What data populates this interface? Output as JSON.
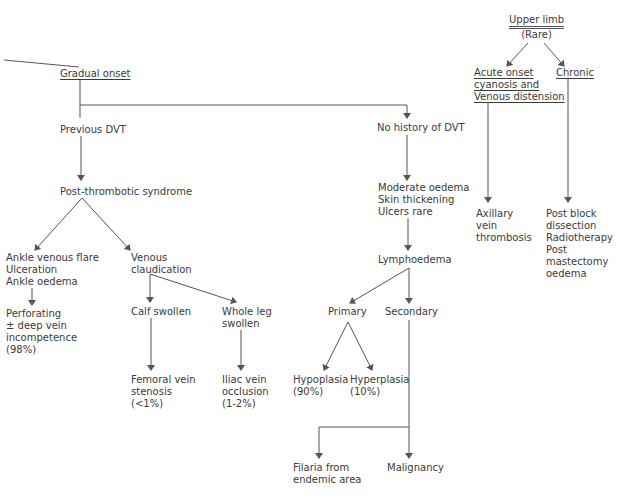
{
  "diagram": {
    "left_branch": {
      "root": "Gradual onset",
      "previous_dvt": "Previous DVT",
      "post_thrombotic": "Post-thrombotic syndrome",
      "ankle_group": [
        "Ankle venous flare",
        "Ulceration",
        "Ankle oedema"
      ],
      "venous_claudication": [
        "Venous",
        "claudication"
      ],
      "perforating": [
        "Perforating",
        "± deep vein",
        "incompetence",
        "(98%)"
      ],
      "calf_swollen": "Calf swollen",
      "whole_leg": [
        "Whole leg",
        "swollen"
      ],
      "femoral": [
        "Femoral vein",
        "stenosis",
        "(<1%)"
      ],
      "iliac": [
        "Iliac vein",
        "occlusion",
        "(1-2%)"
      ]
    },
    "middle_branch": {
      "no_history": "No history of DVT",
      "symptoms": [
        "Moderate oedema",
        "Skin thickening",
        "Ulcers rare"
      ],
      "lymphoedema": "Lymphoedema",
      "primary": "Primary",
      "secondary": "Secondary",
      "hypoplasia": [
        "Hypoplasia",
        "(90%)"
      ],
      "hyperplasia": [
        "Hyperplasia",
        "(10%)"
      ],
      "filaria": [
        "Filaria from",
        "endemic area"
      ],
      "malignancy": "Malignancy"
    },
    "right_branch": {
      "upper_limb": "Upper limb",
      "rare": "(Rare)",
      "acute": [
        "Acute onset",
        "cyanosis and",
        "Venous distension"
      ],
      "chronic": "Chronic",
      "axillary": [
        "Axillary",
        "vein",
        "thrombosis"
      ],
      "chronic_causes": [
        "Post block",
        "dissection",
        "Radiotherapy",
        "Post",
        "mastectomy",
        "oedema"
      ]
    }
  }
}
